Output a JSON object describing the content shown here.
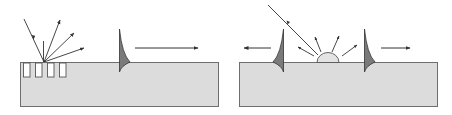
{
  "figure": {
    "title": "Surface wave generation: laser ablation (left) and thermoelastic/ablative source (right)",
    "panels": [
      {
        "id": "left",
        "name": "pitted-surface-panel",
        "elements": [
          "incident-ray",
          "reflected-rays",
          "surface-pits",
          "surface-wave-pulse",
          "propagation-arrow-right"
        ]
      },
      {
        "id": "right",
        "name": "dome-source-panel",
        "elements": [
          "incident-ray",
          "dome-bump",
          "emission-rays",
          "surface-wave-pulse-left",
          "surface-wave-pulse-right",
          "propagation-arrow-left",
          "propagation-arrow-right"
        ]
      }
    ]
  },
  "colors": {
    "block_fill": "#dcdcdc",
    "block_stroke": "#6e6e6e",
    "pulse_fill": "#7a7a7a",
    "line": "#333333",
    "dome_fill": "#e4e4e4",
    "background": "#ffffff"
  }
}
